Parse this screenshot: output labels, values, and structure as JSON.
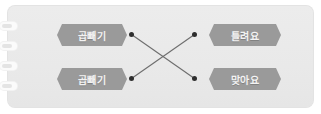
{
  "card": {
    "background_color": "#ebebeb",
    "binding": {
      "name": "spiral-binding",
      "ring_count": 4,
      "ring_color": "#fbfbfb"
    }
  },
  "matching_exercise": {
    "label_color": "#9a9a9a",
    "label_text_color": "#f3f3f3",
    "connector_color": "#2e2e2e",
    "left_items": [
      {
        "id": "left-top",
        "label": "곱빼기"
      },
      {
        "id": "left-bottom",
        "label": "곱빼기"
      }
    ],
    "right_items": [
      {
        "id": "right-top",
        "label": "틀려요"
      },
      {
        "id": "right-bottom",
        "label": "맞아요"
      }
    ],
    "connections": [
      {
        "from": "left-top",
        "to": "right-bottom"
      },
      {
        "from": "left-bottom",
        "to": "right-top"
      }
    ]
  }
}
